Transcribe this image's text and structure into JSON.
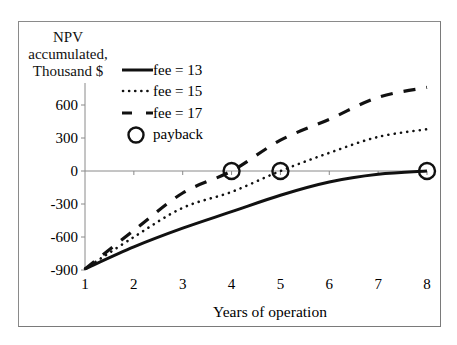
{
  "chart_data": {
    "type": "line",
    "title": "",
    "ylabel": "NPV accumulated, Thousand $",
    "xlabel": "Years of operation",
    "x": [
      1,
      2,
      3,
      4,
      5,
      6,
      7,
      8
    ],
    "xlim": [
      1,
      8
    ],
    "ylim": [
      -900,
      800
    ],
    "yticks": [
      600,
      300,
      0,
      -300,
      -600,
      -900
    ],
    "xticks": [
      1,
      2,
      3,
      4,
      5,
      6,
      7,
      8
    ],
    "grid": false,
    "legend_position": "upper-left-inside",
    "series": [
      {
        "name": "fee = 13",
        "style": "solid",
        "values": [
          -890,
          -690,
          -520,
          -370,
          -220,
          -100,
          -30,
          0
        ]
      },
      {
        "name": "fee = 15",
        "style": "dotted",
        "values": [
          -890,
          -600,
          -335,
          -190,
          0,
          165,
          310,
          380
        ]
      },
      {
        "name": "fee = 17",
        "style": "dashed",
        "values": [
          -890,
          -540,
          -200,
          0,
          280,
          470,
          670,
          760
        ]
      }
    ],
    "markers": {
      "name": "payback",
      "points": [
        {
          "series": "fee = 17",
          "x": 4,
          "y": 0
        },
        {
          "series": "fee = 15",
          "x": 5,
          "y": 0
        },
        {
          "series": "fee = 13",
          "x": 8,
          "y": 0
        }
      ]
    }
  },
  "labels": {
    "ylabel_lines": [
      "NPV",
      "accumulated,",
      "Thousand $"
    ],
    "xlabel": "Years of operation",
    "yticks": [
      "600",
      "300",
      "0",
      "-300",
      "-600",
      "-900"
    ],
    "xticks": [
      "1",
      "2",
      "3",
      "4",
      "5",
      "6",
      "7",
      "8"
    ],
    "legend": [
      "fee = 13",
      "fee = 15",
      "fee = 17",
      "payback"
    ]
  }
}
